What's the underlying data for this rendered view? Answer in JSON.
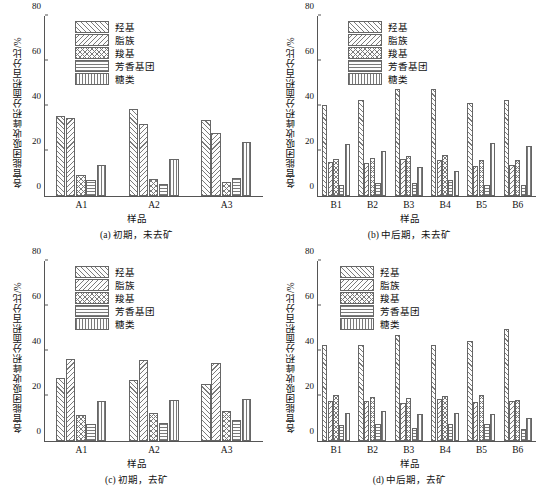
{
  "axis": {
    "ylabel": "各官能团吸收峰积分面积百分比/%",
    "xlabel": "样品",
    "yticks": [
      "0",
      "20",
      "40",
      "60",
      "80"
    ]
  },
  "legend": [
    {
      "label": "羟基",
      "pattern": "h-fwd"
    },
    {
      "label": "脂族",
      "pattern": "h-back"
    },
    {
      "label": "羧基",
      "pattern": "h-cross"
    },
    {
      "label": "芳香基团",
      "pattern": "h-horiz"
    },
    {
      "label": "糖类",
      "pattern": "h-vert"
    }
  ],
  "panels": {
    "a": {
      "caption": "(a) 初期，未去矿"
    },
    "b": {
      "caption": "(b) 中后期，未去矿"
    },
    "c": {
      "caption": "(c) 初期，去矿"
    },
    "d": {
      "caption": "(d) 中后期，去矿"
    }
  },
  "chart_data": [
    {
      "type": "bar",
      "panel": "a",
      "title": "(a) 初期，未去矿",
      "xlabel": "样品",
      "ylabel": "各官能团吸收峰积分面积百分比/%",
      "ylim": [
        0,
        80
      ],
      "yticks": [
        0,
        20,
        40,
        60,
        80
      ],
      "grid": false,
      "legend_position": "upper-left",
      "categories": [
        "A1",
        "A2",
        "A3"
      ],
      "series": [
        {
          "name": "羟基",
          "values": [
            35.5,
            38.8,
            33.8
          ]
        },
        {
          "name": "脂族",
          "values": [
            34.5,
            31.8,
            27.8
          ]
        },
        {
          "name": "羧基",
          "values": [
            9.2,
            7.4,
            6.4
          ]
        },
        {
          "name": "芳香基团",
          "values": [
            7.0,
            5.4,
            7.8
          ]
        },
        {
          "name": "糖类",
          "values": [
            14.0,
            16.6,
            24.0
          ]
        }
      ]
    },
    {
      "type": "bar",
      "panel": "b",
      "title": "(b) 中后期，未去矿",
      "xlabel": "样品",
      "ylabel": "各官能团吸收峰积分面积百分比/%",
      "ylim": [
        0,
        80
      ],
      "yticks": [
        0,
        20,
        40,
        60,
        80
      ],
      "grid": false,
      "legend_position": "upper-left",
      "categories": [
        "B1",
        "B2",
        "B3",
        "B4",
        "B5",
        "B6"
      ],
      "series": [
        {
          "name": "羟基",
          "values": [
            40.4,
            42.8,
            47.4,
            47.6,
            41.4,
            42.8
          ]
        },
        {
          "name": "脂族",
          "values": [
            15.2,
            14.6,
            16.4,
            16.2,
            13.4,
            14.0
          ]
        },
        {
          "name": "羧基",
          "values": [
            16.4,
            16.8,
            18.0,
            18.2,
            16.0,
            16.0
          ]
        },
        {
          "name": "芳香基团",
          "values": [
            5.0,
            6.0,
            5.6,
            7.0,
            5.0,
            5.0
          ]
        },
        {
          "name": "糖类",
          "values": [
            23.0,
            19.8,
            12.8,
            11.0,
            23.6,
            22.2
          ]
        }
      ]
    },
    {
      "type": "bar",
      "panel": "c",
      "title": "(c) 初期，去矿",
      "xlabel": "样品",
      "ylabel": "各官能团吸收峰积分面积百分比/%",
      "ylim": [
        0,
        80
      ],
      "yticks": [
        0,
        20,
        40,
        60,
        80
      ],
      "grid": false,
      "legend_position": "upper-left",
      "categories": [
        "A1",
        "A2",
        "A3"
      ],
      "series": [
        {
          "name": "羟基",
          "values": [
            27.8,
            27.2,
            25.2
          ]
        },
        {
          "name": "脂族",
          "values": [
            36.4,
            36.0,
            34.8
          ]
        },
        {
          "name": "羧基",
          "values": [
            11.6,
            12.4,
            13.4
          ]
        },
        {
          "name": "芳香基团",
          "values": [
            7.4,
            8.0,
            9.2
          ]
        },
        {
          "name": "糖类",
          "values": [
            17.8,
            18.2,
            18.8
          ]
        }
      ]
    },
    {
      "type": "bar",
      "panel": "d",
      "title": "(d) 中后期，去矿",
      "xlabel": "样品",
      "ylabel": "各官能团吸收峰积分面积百分比/%",
      "ylim": [
        0,
        80
      ],
      "yticks": [
        0,
        20,
        40,
        60,
        80
      ],
      "grid": false,
      "legend_position": "upper-left",
      "categories": [
        "B1",
        "B2",
        "B3",
        "B4",
        "B5",
        "B6"
      ],
      "series": [
        {
          "name": "羟基",
          "values": [
            42.8,
            42.8,
            47.0,
            42.8,
            44.4,
            50.0
          ]
        },
        {
          "name": "脂族",
          "values": [
            17.6,
            17.6,
            17.0,
            18.6,
            17.2,
            17.6
          ]
        },
        {
          "name": "羧基",
          "values": [
            20.4,
            19.6,
            19.2,
            19.8,
            20.4,
            18.2
          ]
        },
        {
          "name": "芳香基团",
          "values": [
            7.2,
            7.4,
            6.0,
            7.4,
            7.4,
            5.4
          ]
        },
        {
          "name": "糖类",
          "values": [
            12.6,
            13.4,
            11.8,
            12.4,
            12.2,
            10.4
          ]
        }
      ]
    }
  ]
}
